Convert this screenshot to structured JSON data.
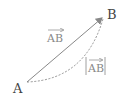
{
  "diagram": {
    "points": [
      {
        "label": "A",
        "x": 27,
        "y": 82
      },
      {
        "label": "B",
        "x": 103,
        "y": 17
      }
    ],
    "vector_label": "AB",
    "magnitude_label": "AB",
    "colors": {
      "arrow": "#888888",
      "dashed_path": "#888888",
      "point_labels": "#444444",
      "annotation_labels": "#888888"
    }
  }
}
